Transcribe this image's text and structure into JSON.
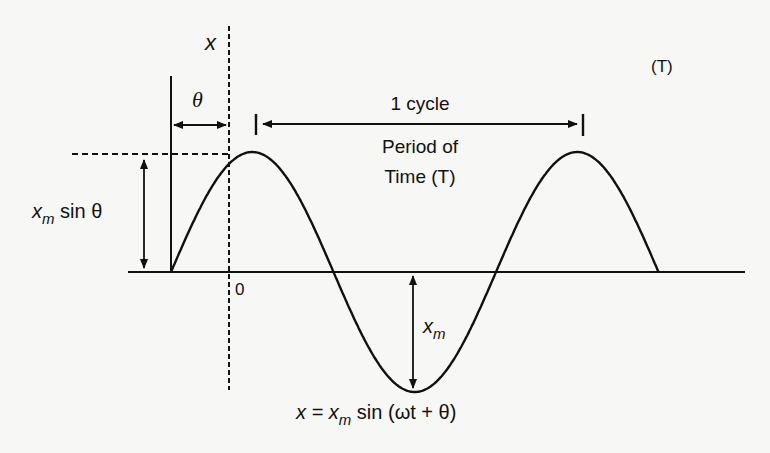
{
  "diagram": {
    "title_corner": "(T)",
    "axis_x_label": "x",
    "origin_label": "0",
    "phase_label": "θ",
    "cycle_label": "1 cycle",
    "period_label_line1": "Period of",
    "period_label_line2": "Time (T)",
    "initial_value_label": {
      "base": "x",
      "sub": "m",
      "rest": " sin θ"
    },
    "amplitude_label": {
      "base": "x",
      "sub": "m"
    },
    "equation": {
      "lhs": "x = ",
      "base": "x",
      "sub": "m",
      "rest": " sin (ωt + θ)"
    },
    "wave": {
      "function": "x = x_m sin(ωt + θ)",
      "phase_theta_fraction_of_cycle": 0.18,
      "cycles_shown": 1.5
    },
    "colors": {
      "ink": "#111111",
      "paper": "#f7f7f5"
    }
  }
}
